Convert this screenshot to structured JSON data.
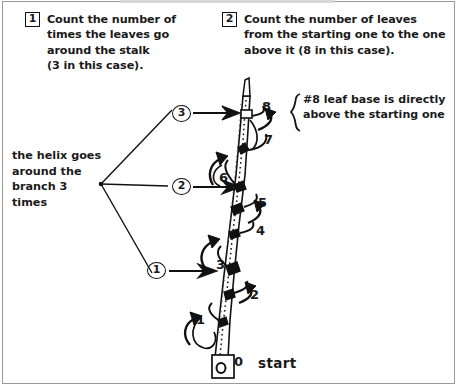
{
  "figure": {
    "title_cutoff_strip": "",
    "steps": [
      {
        "number": "1",
        "text": "Count the number of\ntimes the leaves go\naround the stalk\n(3 in this case)."
      },
      {
        "number": "2",
        "text": "Count the number of leaves\nfrom the starting one to the one\nabove it (8 in this case)."
      }
    ],
    "helix_note": "the helix goes\naround the\nbranch 3\ntimes",
    "brace_note": "#8 leaf base is directly\nabove the starting one",
    "circled_markers": [
      {
        "label": "3"
      },
      {
        "label": "2"
      },
      {
        "label": "1"
      }
    ],
    "leaf_numbers": [
      {
        "label": "8"
      },
      {
        "label": "7"
      },
      {
        "label": "6"
      },
      {
        "label": "5"
      },
      {
        "label": "4"
      },
      {
        "label": "3"
      },
      {
        "label": "2"
      },
      {
        "label": "1"
      },
      {
        "label": "0"
      }
    ],
    "start_label": "start",
    "colors": {
      "ink": "#111111",
      "paper": "#ffffff",
      "frame": "#9a9a9a"
    }
  }
}
